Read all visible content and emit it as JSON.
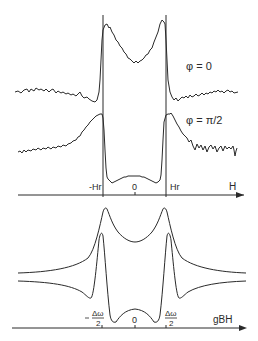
{
  "figure": {
    "top_panel": {
      "traces": [
        {
          "label": "φ = 0",
          "type": "experimental absorption spectrum, two-horned"
        },
        {
          "label": "φ = π/2",
          "type": "experimental spectrum, inverted central band"
        }
      ],
      "axis": {
        "name": "H",
        "ticks": [
          {
            "label": "-Hr"
          },
          {
            "label": "0"
          },
          {
            "label": "Hr"
          }
        ]
      }
    },
    "bottom_panel": {
      "traces": [
        {
          "type": "theoretical curve, two peaks at ±Δω/2"
        },
        {
          "type": "theoretical curve, dispersive features at ±Δω/2"
        }
      ],
      "axis": {
        "name": "gBH",
        "ticks": [
          {
            "label_num": "Δω",
            "label_den": "2",
            "sign": "-"
          },
          {
            "label": "0"
          },
          {
            "label_num": "Δω",
            "label_den": "2",
            "sign": ""
          }
        ]
      }
    },
    "line_color": "#2a2a2a",
    "background": "#ffffff"
  }
}
